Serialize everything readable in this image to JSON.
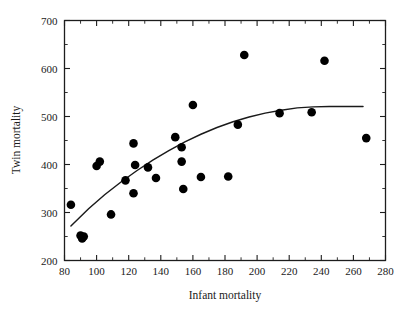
{
  "chart_data": {
    "type": "scatter",
    "title": "",
    "xlabel": "Infant mortality",
    "ylabel": "Twin mortality",
    "xlim": [
      80,
      280
    ],
    "ylim": [
      200,
      700
    ],
    "xticks": [
      80,
      100,
      120,
      140,
      160,
      180,
      200,
      220,
      240,
      260,
      280
    ],
    "xtick_labels": [
      "80",
      "100",
      "120",
      "140",
      "160",
      "180",
      "200",
      "220",
      "240",
      "260",
      "280"
    ],
    "yticks": [
      200,
      300,
      400,
      500,
      600,
      700
    ],
    "ytick_labels": [
      "200",
      "300",
      "400",
      "500",
      "600",
      "700"
    ],
    "x_minor_step": 10,
    "y_minor_step": 50,
    "grid": false,
    "legend": null,
    "marker": "filled-circle",
    "marker_color": "#000000",
    "points": [
      {
        "x": 84,
        "y": 316
      },
      {
        "x": 90,
        "y": 252
      },
      {
        "x": 91,
        "y": 246
      },
      {
        "x": 92,
        "y": 250
      },
      {
        "x": 100,
        "y": 397
      },
      {
        "x": 102,
        "y": 406
      },
      {
        "x": 109,
        "y": 296
      },
      {
        "x": 118,
        "y": 367
      },
      {
        "x": 123,
        "y": 444
      },
      {
        "x": 123,
        "y": 340
      },
      {
        "x": 124,
        "y": 399
      },
      {
        "x": 132,
        "y": 394
      },
      {
        "x": 137,
        "y": 372
      },
      {
        "x": 149,
        "y": 457
      },
      {
        "x": 153,
        "y": 436
      },
      {
        "x": 153,
        "y": 406
      },
      {
        "x": 154,
        "y": 349
      },
      {
        "x": 160,
        "y": 524
      },
      {
        "x": 165,
        "y": 374
      },
      {
        "x": 182,
        "y": 375
      },
      {
        "x": 188,
        "y": 483
      },
      {
        "x": 192,
        "y": 628
      },
      {
        "x": 214,
        "y": 507
      },
      {
        "x": 234,
        "y": 509
      },
      {
        "x": 242,
        "y": 616
      },
      {
        "x": 268,
        "y": 455
      }
    ],
    "fit_curve": {
      "description": "quadratic trend line",
      "x": [
        84,
        95,
        105,
        115,
        125,
        135,
        145,
        155,
        165,
        175,
        185,
        195,
        205,
        215,
        225,
        235,
        245,
        255,
        266
      ],
      "y": [
        272,
        308,
        337,
        363,
        387,
        409,
        429,
        447,
        463,
        477,
        489,
        499,
        507,
        513,
        518,
        520,
        521,
        521,
        521
      ]
    }
  },
  "colors": {
    "background": "#ffffff",
    "axis": "#1d1d1d",
    "marker": "#000000",
    "curve": "#1a1a1a"
  }
}
